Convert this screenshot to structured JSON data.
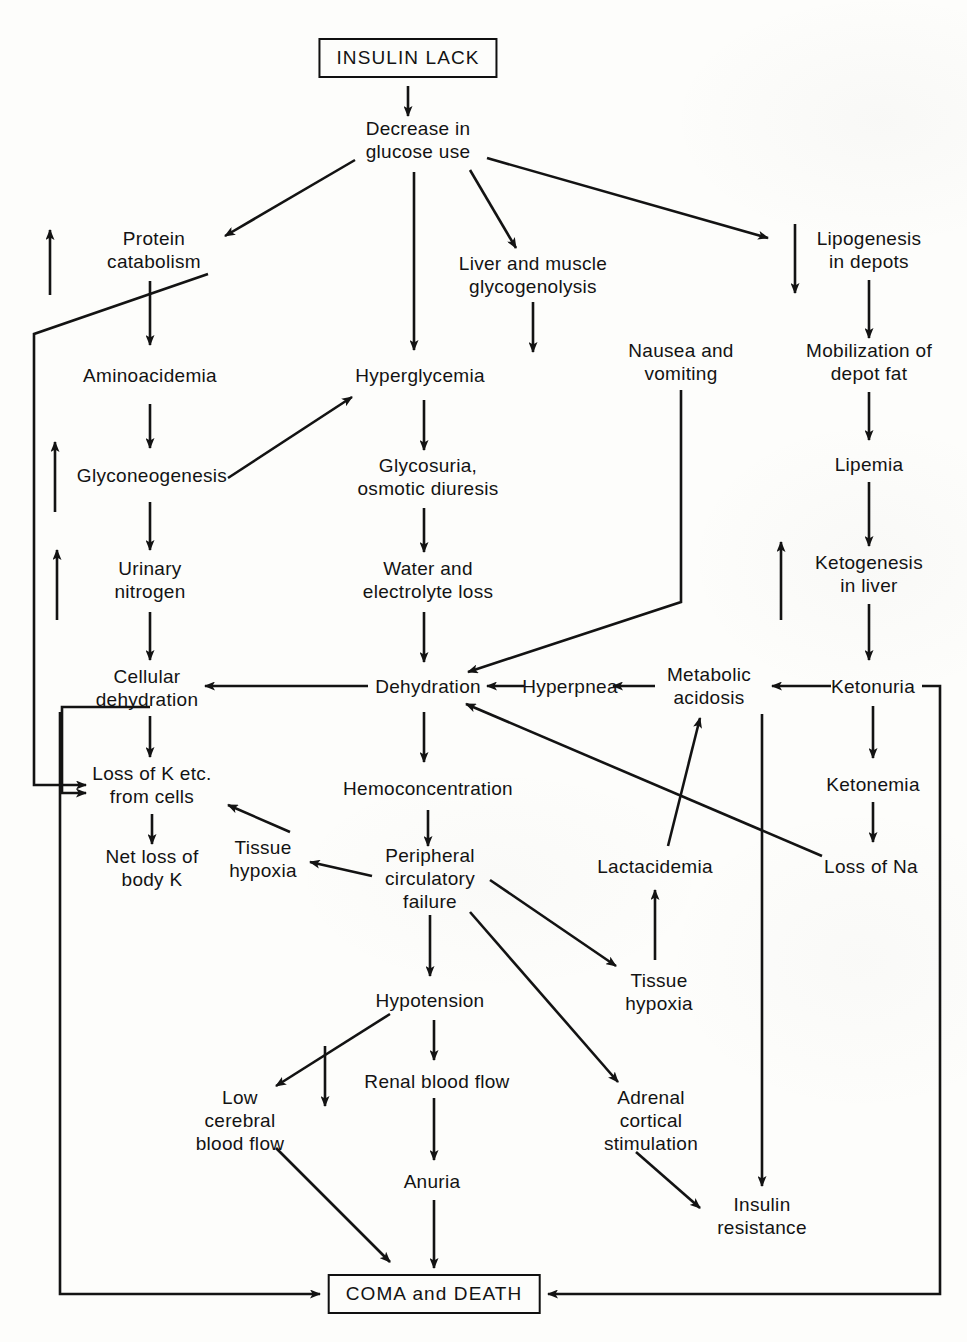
{
  "diagram": {
    "title": "INSULIN LACK",
    "kind": "medical-pathophysiology-flowchart",
    "background_color": "#fdfdfb",
    "ink_color": "#131313",
    "nodes": [
      {
        "id": "insulin-lack",
        "label": "INSULIN LACK",
        "x": 408,
        "y": 58,
        "boxed": true
      },
      {
        "id": "decrease-glucose",
        "label": "Decrease in\nglucose use",
        "x": 418,
        "y": 140,
        "boxed": false
      },
      {
        "id": "protein-catabolism",
        "label": "Protein\ncatabolism",
        "x": 154,
        "y": 250,
        "boxed": false
      },
      {
        "id": "liver-glycogenolysis",
        "label": "Liver and muscle\nglycogenolysis",
        "x": 533,
        "y": 275,
        "boxed": false
      },
      {
        "id": "lipogenesis",
        "label": "Lipogenesis\nin depots",
        "x": 869,
        "y": 250,
        "boxed": false
      },
      {
        "id": "aminoacidemia",
        "label": "Aminoacidemia",
        "x": 150,
        "y": 375,
        "boxed": false
      },
      {
        "id": "hyperglycemia",
        "label": "Hyperglycemia",
        "x": 420,
        "y": 375,
        "boxed": false
      },
      {
        "id": "nausea-vomiting",
        "label": "Nausea and\nvomiting",
        "x": 681,
        "y": 362,
        "boxed": false
      },
      {
        "id": "mobilization-fat",
        "label": "Mobilization of\ndepot fat",
        "x": 869,
        "y": 362,
        "boxed": false
      },
      {
        "id": "glyconeogenesis",
        "label": "Glyconeogenesis",
        "x": 152,
        "y": 475,
        "boxed": false
      },
      {
        "id": "glycosuria",
        "label": "Glycosuria,\nosmotic diuresis",
        "x": 428,
        "y": 477,
        "boxed": false
      },
      {
        "id": "lipemia",
        "label": "Lipemia",
        "x": 869,
        "y": 464,
        "boxed": false
      },
      {
        "id": "urinary-nitrogen",
        "label": "Urinary\nnitrogen",
        "x": 150,
        "y": 580,
        "boxed": false
      },
      {
        "id": "water-electrolyte",
        "label": "Water and\nelectrolyte loss",
        "x": 428,
        "y": 580,
        "boxed": false
      },
      {
        "id": "ketogenesis",
        "label": "Ketogenesis\nin liver",
        "x": 869,
        "y": 574,
        "boxed": false
      },
      {
        "id": "cellular-dehydration",
        "label": "Cellular\ndehydration",
        "x": 147,
        "y": 688,
        "boxed": false
      },
      {
        "id": "dehydration",
        "label": "Dehydration",
        "x": 428,
        "y": 686,
        "boxed": false
      },
      {
        "id": "hyperpnea",
        "label": "Hyperpnea",
        "x": 570,
        "y": 686,
        "boxed": false
      },
      {
        "id": "metabolic-acidosis",
        "label": "Metabolic\nacidosis",
        "x": 709,
        "y": 686,
        "boxed": false
      },
      {
        "id": "ketonuria",
        "label": "Ketonuria",
        "x": 873,
        "y": 686,
        "boxed": false
      },
      {
        "id": "loss-of-k",
        "label": "Loss of K etc.\nfrom cells",
        "x": 152,
        "y": 785,
        "boxed": false
      },
      {
        "id": "hemoconcentration",
        "label": "Hemoconcentration",
        "x": 428,
        "y": 788,
        "boxed": false
      },
      {
        "id": "ketonemia",
        "label": "Ketonemia",
        "x": 873,
        "y": 784,
        "boxed": false
      },
      {
        "id": "tissue-hypoxia-left",
        "label": "Tissue\nhypoxia",
        "x": 263,
        "y": 859,
        "boxed": false
      },
      {
        "id": "net-loss-body-k",
        "label": "Net loss of\nbody K",
        "x": 152,
        "y": 868,
        "boxed": false
      },
      {
        "id": "peripheral-failure",
        "label": "Peripheral\ncirculatory\nfailure",
        "x": 430,
        "y": 878,
        "boxed": false
      },
      {
        "id": "lactacidemia",
        "label": "Lactacidemia",
        "x": 655,
        "y": 866,
        "boxed": false
      },
      {
        "id": "loss-of-na",
        "label": "Loss of Na",
        "x": 871,
        "y": 866,
        "boxed": false
      },
      {
        "id": "hypotension",
        "label": "Hypotension",
        "x": 430,
        "y": 1000,
        "boxed": false
      },
      {
        "id": "tissue-hypoxia-right",
        "label": "Tissue\nhypoxia",
        "x": 659,
        "y": 992,
        "boxed": false
      },
      {
        "id": "renal-blood-flow",
        "label": "Renal blood flow",
        "x": 437,
        "y": 1081,
        "boxed": false
      },
      {
        "id": "low-cerebral",
        "label": "Low\ncerebral\nblood flow",
        "x": 240,
        "y": 1120,
        "boxed": false
      },
      {
        "id": "adrenal-stimulation",
        "label": "Adrenal\ncortical\nstimulation",
        "x": 651,
        "y": 1120,
        "boxed": false
      },
      {
        "id": "anuria",
        "label": "Anuria",
        "x": 432,
        "y": 1181,
        "boxed": false
      },
      {
        "id": "insulin-resistance",
        "label": "Insulin\nresistance",
        "x": 762,
        "y": 1216,
        "boxed": false
      },
      {
        "id": "coma-death",
        "label": "COMA and DEATH",
        "x": 434,
        "y": 1294,
        "boxed": true
      }
    ],
    "edges": [
      {
        "from": "insulin-lack",
        "to": "decrease-glucose"
      },
      {
        "from": "decrease-glucose",
        "to": "protein-catabolism"
      },
      {
        "from": "decrease-glucose",
        "to": "hyperglycemia"
      },
      {
        "from": "decrease-glucose",
        "to": "liver-glycogenolysis"
      },
      {
        "from": "decrease-glucose",
        "to": "lipogenesis"
      },
      {
        "from": "protein-catabolism",
        "to": "aminoacidemia"
      },
      {
        "from": "protein-catabolism",
        "to": "loss-of-k"
      },
      {
        "from": "liver-glycogenolysis",
        "to": "hyperglycemia"
      },
      {
        "from": "lipogenesis",
        "to": "mobilization-fat"
      },
      {
        "from": "aminoacidemia",
        "to": "glyconeogenesis"
      },
      {
        "from": "glyconeogenesis",
        "to": "hyperglycemia"
      },
      {
        "from": "glyconeogenesis",
        "to": "urinary-nitrogen"
      },
      {
        "from": "hyperglycemia",
        "to": "glycosuria"
      },
      {
        "from": "mobilization-fat",
        "to": "lipemia"
      },
      {
        "from": "glycosuria",
        "to": "water-electrolyte"
      },
      {
        "from": "lipemia",
        "to": "ketogenesis"
      },
      {
        "from": "urinary-nitrogen",
        "to": "cellular-dehydration"
      },
      {
        "from": "water-electrolyte",
        "to": "dehydration"
      },
      {
        "from": "nausea-vomiting",
        "to": "dehydration"
      },
      {
        "from": "ketogenesis",
        "to": "ketonuria"
      },
      {
        "from": "dehydration",
        "to": "cellular-dehydration"
      },
      {
        "from": "hyperpnea",
        "to": "dehydration"
      },
      {
        "from": "metabolic-acidosis",
        "to": "hyperpnea"
      },
      {
        "from": "ketonuria",
        "to": "metabolic-acidosis"
      },
      {
        "from": "ketonuria",
        "to": "ketonemia"
      },
      {
        "from": "ketonuria",
        "to": "coma-death"
      },
      {
        "from": "cellular-dehydration",
        "to": "loss-of-k"
      },
      {
        "from": "cellular-dehydration",
        "to": "coma-death"
      },
      {
        "from": "dehydration",
        "to": "hemoconcentration"
      },
      {
        "from": "ketonemia",
        "to": "loss-of-na"
      },
      {
        "from": "loss-of-na",
        "to": "dehydration"
      },
      {
        "from": "loss-of-k",
        "to": "net-loss-body-k"
      },
      {
        "from": "hemoconcentration",
        "to": "peripheral-failure"
      },
      {
        "from": "peripheral-failure",
        "to": "tissue-hypoxia-left"
      },
      {
        "from": "tissue-hypoxia-left",
        "to": "loss-of-k"
      },
      {
        "from": "peripheral-failure",
        "to": "tissue-hypoxia-right"
      },
      {
        "from": "tissue-hypoxia-right",
        "to": "lactacidemia"
      },
      {
        "from": "lactacidemia",
        "to": "metabolic-acidosis"
      },
      {
        "from": "peripheral-failure",
        "to": "hypotension"
      },
      {
        "from": "peripheral-failure",
        "to": "adrenal-stimulation"
      },
      {
        "from": "hypotension",
        "to": "low-cerebral"
      },
      {
        "from": "hypotension",
        "to": "renal-blood-flow"
      },
      {
        "from": "renal-blood-flow",
        "to": "anuria"
      },
      {
        "from": "anuria",
        "to": "coma-death"
      },
      {
        "from": "low-cerebral",
        "to": "coma-death"
      },
      {
        "from": "adrenal-stimulation",
        "to": "insulin-resistance"
      },
      {
        "from": "metabolic-acidosis",
        "to": "insulin-resistance"
      }
    ],
    "standalone_arrows": [
      {
        "id": "left-up-arrow-1",
        "direction": "up",
        "x": 50,
        "y_top": 228,
        "y_bottom": 295
      },
      {
        "id": "left-up-arrow-2",
        "direction": "up",
        "x": 55,
        "y_top": 440,
        "y_bottom": 512
      },
      {
        "id": "left-up-arrow-3",
        "direction": "up",
        "x": 57,
        "y_top": 548,
        "y_bottom": 620
      },
      {
        "id": "right-down-arrow",
        "direction": "down",
        "x": 795,
        "y_top": 224,
        "y_bottom": 295
      },
      {
        "id": "ketone-up-arrow",
        "direction": "up",
        "x": 781,
        "y_top": 540,
        "y_bottom": 620
      },
      {
        "id": "hypotension-down-arrow",
        "direction": "down",
        "x": 325,
        "y_top": 1046,
        "y_bottom": 1108
      }
    ]
  }
}
